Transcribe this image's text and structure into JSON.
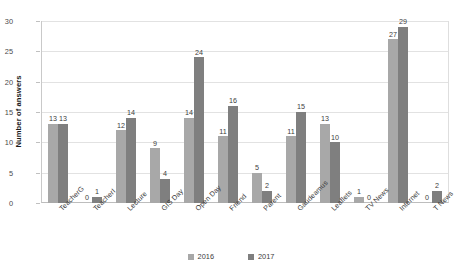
{
  "chart_data": {
    "type": "bar",
    "title": "",
    "xlabel": "",
    "ylabel": "Number of answers",
    "ylim": [
      0,
      30
    ],
    "ytick_step": 5,
    "yticks": [
      0,
      5,
      10,
      15,
      20,
      25,
      30
    ],
    "grid": true,
    "legend_position": "bottom",
    "categories": [
      "TeacherG",
      "TeacherI",
      "Lecture",
      "GIS Day",
      "Open Day",
      "Friend",
      "Parent",
      "Gaudeamus",
      "Leaflets",
      "TV News",
      "Internet",
      "T News"
    ],
    "series": [
      {
        "name": "2016",
        "color": "#a8a8a8",
        "values": [
          13,
          0,
          12,
          9,
          14,
          11,
          5,
          11,
          13,
          1,
          27,
          0
        ]
      },
      {
        "name": "2017",
        "color": "#7f7f7f",
        "values": [
          13,
          1,
          14,
          4,
          24,
          16,
          2,
          15,
          10,
          0,
          29,
          2
        ]
      }
    ]
  },
  "legend": {
    "items": [
      {
        "label": "2016"
      },
      {
        "label": "2017"
      }
    ]
  }
}
